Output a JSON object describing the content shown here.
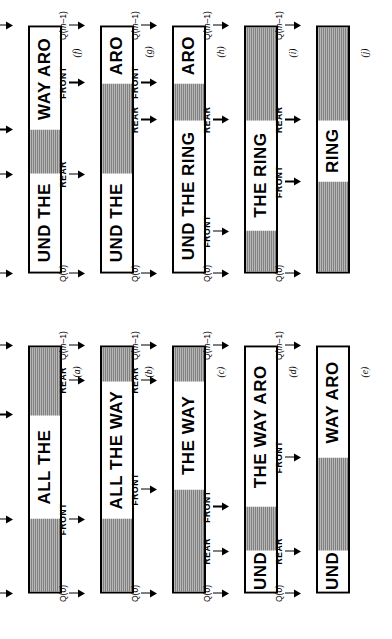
{
  "figure": {
    "orientation_deg": -90,
    "marker_labels": {
      "q0": "Q(0)",
      "qm1": "Q(m-1)",
      "front": "FRONT",
      "rear": "REAR"
    },
    "colors": {
      "ink": "#000000",
      "empty_fill": "#d9d9d9",
      "full_fill": "#ffffff",
      "page": "#ffffff"
    }
  },
  "panels": [
    {
      "id": "a",
      "label": "(a)",
      "text": "ALL THE",
      "segments": [
        {
          "kind": "empty",
          "pct": 30,
          "text": ""
        },
        {
          "kind": "full",
          "pct": 42,
          "text": "ALL THE"
        },
        {
          "kind": "empty",
          "pct": 28,
          "text": ""
        }
      ],
      "markers": [
        {
          "name": "q0",
          "label": "Q(0)",
          "pct": 0
        },
        {
          "name": "front",
          "label": "FRONT",
          "pct": 30
        },
        {
          "name": "rear",
          "label": "REAR",
          "pct": 72
        },
        {
          "name": "qm1",
          "label": "Q(m-1)",
          "pct": 100
        }
      ]
    },
    {
      "id": "b",
      "label": "(b)",
      "text": "ALL THE WAY",
      "segments": [
        {
          "kind": "empty",
          "pct": 30,
          "text": ""
        },
        {
          "kind": "full",
          "pct": 56,
          "text": "ALL THE WAY"
        },
        {
          "kind": "empty",
          "pct": 14,
          "text": ""
        }
      ],
      "markers": [
        {
          "name": "q0",
          "label": "Q(0)",
          "pct": 0
        },
        {
          "name": "front",
          "label": "FRONT",
          "pct": 30
        },
        {
          "name": "rear",
          "label": "REAR",
          "pct": 86
        },
        {
          "name": "qm1",
          "label": "Q(m-1)",
          "pct": 100
        }
      ]
    },
    {
      "id": "c",
      "label": "(c)",
      "text": "THE WAY",
      "segments": [
        {
          "kind": "empty",
          "pct": 42,
          "text": ""
        },
        {
          "kind": "full",
          "pct": 44,
          "text": "THE WAY"
        },
        {
          "kind": "empty",
          "pct": 14,
          "text": ""
        }
      ],
      "markers": [
        {
          "name": "q0",
          "label": "Q(0)",
          "pct": 0
        },
        {
          "name": "front",
          "label": "FRONT",
          "pct": 42
        },
        {
          "name": "rear",
          "label": "REAR",
          "pct": 86
        },
        {
          "name": "qm1",
          "label": "Q(m-1)",
          "pct": 100
        }
      ]
    },
    {
      "id": "d",
      "label": "(d)",
      "text": "UND THE WAY ARO",
      "segments": [
        {
          "kind": "full",
          "pct": 17,
          "text": "UND"
        },
        {
          "kind": "empty",
          "pct": 18,
          "text": ""
        },
        {
          "kind": "full",
          "pct": 65,
          "text": "THE WAY ARO"
        }
      ],
      "markers": [
        {
          "name": "q0",
          "label": "Q(0)",
          "pct": 0
        },
        {
          "name": "rear",
          "label": "REAR",
          "pct": 17
        },
        {
          "name": "front",
          "label": "FRONT",
          "pct": 35
        },
        {
          "name": "qm1",
          "label": "Q(m-1)",
          "pct": 100
        }
      ]
    },
    {
      "id": "e",
      "label": "(e)",
      "text": "UND WAY ARO",
      "segments": [
        {
          "kind": "full",
          "pct": 17,
          "text": "UND"
        },
        {
          "kind": "empty",
          "pct": 38,
          "text": ""
        },
        {
          "kind": "full",
          "pct": 45,
          "text": "WAY ARO"
        }
      ],
      "markers": [
        {
          "name": "q0",
          "label": "Q(0)",
          "pct": 0
        },
        {
          "name": "rear",
          "label": "REAR",
          "pct": 17
        },
        {
          "name": "front",
          "label": "FRONT",
          "pct": 55
        },
        {
          "name": "qm1",
          "label": "Q(m-1)",
          "pct": 100
        }
      ]
    },
    {
      "id": "f",
      "label": "(f)",
      "text": "UND THE WAY ARO",
      "segments": [
        {
          "kind": "full",
          "pct": 40,
          "text": "UND THE"
        },
        {
          "kind": "empty",
          "pct": 18,
          "text": ""
        },
        {
          "kind": "full",
          "pct": 42,
          "text": "WAY ARO"
        }
      ],
      "markers": [
        {
          "name": "q0",
          "label": "Q(0)",
          "pct": 0
        },
        {
          "name": "rear",
          "label": "REAR",
          "pct": 40
        },
        {
          "name": "front",
          "label": "FRONT",
          "pct": 58
        },
        {
          "name": "qm1",
          "label": "Q(m-1)",
          "pct": 100
        }
      ]
    },
    {
      "id": "g",
      "label": "(g)",
      "text": "UND THE ARO",
      "segments": [
        {
          "kind": "full",
          "pct": 40,
          "text": "UND THE"
        },
        {
          "kind": "empty",
          "pct": 37,
          "text": ""
        },
        {
          "kind": "full",
          "pct": 23,
          "text": "ARO"
        }
      ],
      "markers": [
        {
          "name": "q0",
          "label": "Q(0)",
          "pct": 0
        },
        {
          "name": "rear",
          "label": "REAR",
          "pct": 40
        },
        {
          "name": "front",
          "label": "FRONT",
          "pct": 77
        },
        {
          "name": "qm1",
          "label": "Q(m-1)",
          "pct": 100
        }
      ]
    },
    {
      "id": "h",
      "label": "(h)",
      "text": "UND THE RING ARO",
      "segments": [
        {
          "kind": "full",
          "pct": 62,
          "text": "UND THE RING"
        },
        {
          "kind": "empty",
          "pct": 15,
          "text": ""
        },
        {
          "kind": "full",
          "pct": 23,
          "text": "ARO"
        }
      ],
      "markers": [
        {
          "name": "q0",
          "label": "Q(0)",
          "pct": 0
        },
        {
          "name": "rear",
          "label": "REAR",
          "pct": 62
        },
        {
          "name": "front",
          "label": "FRONT",
          "pct": 77
        },
        {
          "name": "qm1",
          "label": "Q(m-1)",
          "pct": 100
        }
      ]
    },
    {
      "id": "i",
      "label": "(i)",
      "text": "THE RING",
      "segments": [
        {
          "kind": "empty",
          "pct": 17,
          "text": ""
        },
        {
          "kind": "full",
          "pct": 45,
          "text": "THE RING"
        },
        {
          "kind": "empty",
          "pct": 38,
          "text": ""
        }
      ],
      "markers": [
        {
          "name": "q0",
          "label": "Q(0)",
          "pct": 0
        },
        {
          "name": "front",
          "label": "FRONT",
          "pct": 17
        },
        {
          "name": "rear",
          "label": "REAR",
          "pct": 62
        },
        {
          "name": "qm1",
          "label": "Q(m-1)",
          "pct": 100
        }
      ]
    },
    {
      "id": "j",
      "label": "(j)",
      "text": "RING",
      "segments": [
        {
          "kind": "empty",
          "pct": 37,
          "text": ""
        },
        {
          "kind": "full",
          "pct": 25,
          "text": "RING"
        },
        {
          "kind": "empty",
          "pct": 38,
          "text": ""
        }
      ],
      "markers": [
        {
          "name": "q0",
          "label": "Q(0)",
          "pct": 0
        },
        {
          "name": "front",
          "label": "FRONT",
          "pct": 37
        },
        {
          "name": "rear",
          "label": "REAR",
          "pct": 62
        },
        {
          "name": "qm1",
          "label": "Q(m-1)",
          "pct": 100
        }
      ]
    }
  ],
  "layout": {
    "groups": [
      {
        "name": "group-left",
        "panel_ids": [
          "a",
          "b",
          "c",
          "d",
          "e"
        ]
      },
      {
        "name": "group-right",
        "panel_ids": [
          "f",
          "g",
          "h",
          "i",
          "j"
        ]
      }
    ],
    "panel_geometry": {
      "bar_left_px": 46,
      "bar_width_px": 248,
      "rows_y_px": [
        28,
        100,
        172,
        244,
        316
      ],
      "panel_label_dx_px": 262,
      "panel_label_dy_px": 44
    }
  }
}
